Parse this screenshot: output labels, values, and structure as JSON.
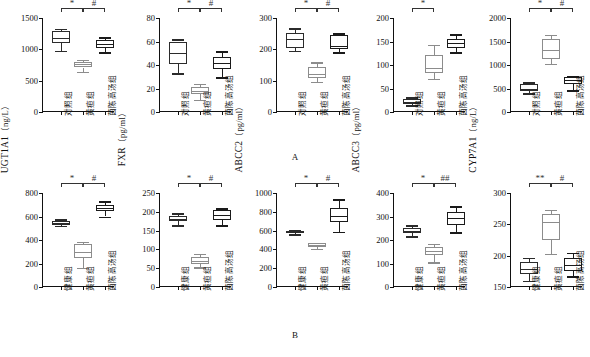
{
  "figure": {
    "row_labels": {
      "a": "A",
      "b": "B"
    },
    "groups_a": [
      "对照组",
      "黄疸组",
      "茵陈高汤组"
    ],
    "groups_b": [
      "健康组",
      "黄疸组",
      "茵陈高汤组"
    ]
  },
  "chart_data": [
    {
      "id": "a-ugt1a1",
      "row": "A",
      "type": "box",
      "title": "UGT1A1",
      "ylabel": "UGT1A1",
      "unit": "（ng/L）",
      "xlabel": "",
      "ylim": [
        0,
        1500
      ],
      "yticks": [
        0,
        500,
        1000,
        1500
      ],
      "categories": [
        "对照组",
        "黄疸组",
        "茵陈高汤组"
      ],
      "boxes": [
        {
          "group": "对照组",
          "min": 980,
          "q1": 1100,
          "median": 1180,
          "q3": 1290,
          "max": 1330
        },
        {
          "group": "黄疸组",
          "min": 640,
          "q1": 710,
          "median": 760,
          "q3": 800,
          "max": 830
        },
        {
          "group": "茵陈高汤组",
          "min": 960,
          "q1": 1020,
          "median": 1090,
          "q3": 1150,
          "max": 1190
        }
      ],
      "significance": [
        {
          "from": 0,
          "to": 1,
          "mark": "*"
        },
        {
          "from": 1,
          "to": 2,
          "mark": "#"
        }
      ]
    },
    {
      "id": "a-fxr",
      "row": "A",
      "type": "box",
      "title": "FXR",
      "ylabel": "FXR",
      "unit": "（pg/ml）",
      "xlabel": "",
      "ylim": [
        0,
        80
      ],
      "yticks": [
        0,
        20,
        40,
        60,
        80
      ],
      "categories": [
        "对照组",
        "黄疸组",
        "茵陈高汤组"
      ],
      "boxes": [
        {
          "group": "对照组",
          "min": 33,
          "q1": 41,
          "median": 50,
          "q3": 60,
          "max": 62
        },
        {
          "group": "黄疸组",
          "min": 10,
          "q1": 15,
          "median": 18,
          "q3": 21,
          "max": 24
        },
        {
          "group": "茵陈高汤组",
          "min": 30,
          "q1": 37,
          "median": 42,
          "q3": 47,
          "max": 52
        }
      ],
      "significance": [
        {
          "from": 0,
          "to": 1,
          "mark": "*"
        },
        {
          "from": 1,
          "to": 2,
          "mark": "#"
        }
      ]
    },
    {
      "id": "a-abcc2",
      "row": "A",
      "type": "box",
      "title": "ABCC2",
      "ylabel": "ABCC2",
      "unit": "（pg/ml）",
      "xlabel": "",
      "ylim": [
        0,
        300
      ],
      "yticks": [
        0,
        100,
        200,
        300
      ],
      "categories": [
        "对照组",
        "黄疸组",
        "茵陈高汤组"
      ],
      "boxes": [
        {
          "group": "对照组",
          "min": 196,
          "q1": 205,
          "median": 232,
          "q3": 252,
          "max": 268
        },
        {
          "group": "黄疸组",
          "min": 95,
          "q1": 110,
          "median": 120,
          "q3": 145,
          "max": 158
        },
        {
          "group": "茵陈高汤组",
          "min": 192,
          "q1": 200,
          "median": 212,
          "q3": 245,
          "max": 252
        }
      ],
      "significance": [
        {
          "from": 0,
          "to": 1,
          "mark": "*"
        },
        {
          "from": 1,
          "to": 2,
          "mark": "#"
        }
      ]
    },
    {
      "id": "a-abcc3",
      "row": "A",
      "type": "box",
      "title": "ABCC3",
      "ylabel": "ABCC3",
      "unit": "（pg/ml）",
      "xlabel": "",
      "ylim": [
        0,
        200
      ],
      "yticks": [
        0,
        50,
        100,
        150,
        200
      ],
      "categories": [
        "对照组",
        "黄疸组",
        "茵陈高汤组"
      ],
      "boxes": [
        {
          "group": "对照组",
          "min": 14,
          "q1": 18,
          "median": 22,
          "q3": 27,
          "max": 31
        },
        {
          "group": "黄疸组",
          "min": 70,
          "q1": 82,
          "median": 93,
          "q3": 122,
          "max": 142
        },
        {
          "group": "茵陈高汤组",
          "min": 127,
          "q1": 136,
          "median": 146,
          "q3": 156,
          "max": 165
        }
      ],
      "significance": [
        {
          "from": 0,
          "to": 1,
          "mark": "*"
        }
      ]
    },
    {
      "id": "a-cyp7a1",
      "row": "A",
      "type": "box",
      "title": "CYP7A1",
      "ylabel": "CYP7A1",
      "unit": "（pg/L）",
      "xlabel": "",
      "ylim": [
        0,
        2000
      ],
      "yticks": [
        0,
        500,
        1000,
        1500,
        2000
      ],
      "categories": [
        "对照组",
        "黄疸组",
        "茵陈高汤组"
      ],
      "boxes": [
        {
          "group": "对照组",
          "min": 400,
          "q1": 450,
          "median": 490,
          "q3": 600,
          "max": 640
        },
        {
          "group": "黄疸组",
          "min": 1030,
          "q1": 1120,
          "median": 1320,
          "q3": 1560,
          "max": 1640
        },
        {
          "group": "茵陈高汤组",
          "min": 470,
          "q1": 600,
          "median": 680,
          "q3": 740,
          "max": 760
        }
      ],
      "significance": [
        {
          "from": 0,
          "to": 1,
          "mark": "*"
        },
        {
          "from": 1,
          "to": 2,
          "mark": "#"
        }
      ]
    },
    {
      "id": "b-ugt1a1",
      "row": "B",
      "type": "box",
      "title": "UGT1A1",
      "ylabel": "UGT1A1",
      "unit": "（ng/L）",
      "xlabel": "",
      "ylim": [
        0,
        800
      ],
      "yticks": [
        0,
        200,
        400,
        600,
        800
      ],
      "categories": [
        "健康组",
        "黄疸组",
        "茵陈高汤组"
      ],
      "boxes": [
        {
          "group": "健康组",
          "min": 520,
          "q1": 530,
          "median": 545,
          "q3": 565,
          "max": 575
        },
        {
          "group": "黄疸组",
          "min": 160,
          "q1": 250,
          "median": 300,
          "q3": 370,
          "max": 385
        },
        {
          "group": "茵陈高汤组",
          "min": 600,
          "q1": 645,
          "median": 670,
          "q3": 700,
          "max": 730
        }
      ],
      "significance": [
        {
          "from": 0,
          "to": 1,
          "mark": "*"
        },
        {
          "from": 1,
          "to": 2,
          "mark": "#"
        }
      ]
    },
    {
      "id": "b-fxr",
      "row": "B",
      "type": "box",
      "title": "FXR",
      "ylabel": "FXR",
      "unit": "（pg/ml）",
      "xlabel": "",
      "ylim": [
        0,
        250
      ],
      "yticks": [
        0,
        50,
        100,
        150,
        200,
        250
      ],
      "categories": [
        "健康组",
        "黄疸组",
        "茵陈高汤组"
      ],
      "boxes": [
        {
          "group": "健康组",
          "min": 165,
          "q1": 175,
          "median": 182,
          "q3": 190,
          "max": 196
        },
        {
          "group": "黄疸组",
          "min": 52,
          "q1": 62,
          "median": 70,
          "q3": 80,
          "max": 88
        },
        {
          "group": "茵陈高汤组",
          "min": 165,
          "q1": 178,
          "median": 192,
          "q3": 205,
          "max": 210
        }
      ],
      "significance": [
        {
          "from": 0,
          "to": 1,
          "mark": "*"
        },
        {
          "from": 1,
          "to": 2,
          "mark": "#"
        }
      ]
    },
    {
      "id": "b-abcc2",
      "row": "B",
      "type": "box",
      "title": "ABCC2",
      "ylabel": "ABCC2",
      "unit": "（pg/ml）",
      "xlabel": "",
      "ylim": [
        0,
        1000
      ],
      "yticks": [
        0,
        200,
        400,
        600,
        800,
        1000
      ],
      "categories": [
        "健康组",
        "黄疸组",
        "茵陈高汤组"
      ],
      "boxes": [
        {
          "group": "健康组",
          "min": 560,
          "q1": 575,
          "median": 590,
          "q3": 600,
          "max": 610
        },
        {
          "group": "黄疸组",
          "min": 405,
          "q1": 430,
          "median": 445,
          "q3": 465,
          "max": 470
        },
        {
          "group": "茵陈高汤组",
          "min": 590,
          "q1": 690,
          "median": 760,
          "q3": 840,
          "max": 940
        }
      ],
      "significance": [
        {
          "from": 0,
          "to": 1,
          "mark": "*"
        },
        {
          "from": 1,
          "to": 2,
          "mark": "#"
        }
      ]
    },
    {
      "id": "b-abcc3",
      "row": "B",
      "type": "box",
      "title": "ABCC3",
      "ylabel": "ABCC3",
      "unit": "（pg/ml）",
      "xlabel": "",
      "ylim": [
        0,
        400
      ],
      "yticks": [
        0,
        100,
        200,
        300,
        400
      ],
      "categories": [
        "健康组",
        "黄疸组",
        "茵陈高汤组"
      ],
      "boxes": [
        {
          "group": "健康组",
          "min": 215,
          "q1": 228,
          "median": 240,
          "q3": 252,
          "max": 262
        },
        {
          "group": "黄疸组",
          "min": 105,
          "q1": 135,
          "median": 152,
          "q3": 172,
          "max": 185
        },
        {
          "group": "茵陈高汤组",
          "min": 232,
          "q1": 262,
          "median": 292,
          "q3": 320,
          "max": 345
        }
      ],
      "significance": [
        {
          "from": 0,
          "to": 1,
          "mark": "*"
        },
        {
          "from": 1,
          "to": 2,
          "mark": "##"
        }
      ]
    },
    {
      "id": "b-cyp7a1",
      "row": "B",
      "type": "box",
      "title": "CYP7A1",
      "ylabel": "CYP7A1",
      "unit": "（ng/L）",
      "xlabel": "",
      "ylim": [
        150,
        300
      ],
      "yticks": [
        150,
        200,
        250,
        300
      ],
      "categories": [
        "健康组",
        "黄疸组",
        "茵陈高汤组"
      ],
      "boxes": [
        {
          "group": "健康组",
          "min": 160,
          "q1": 170,
          "median": 178,
          "q3": 190,
          "max": 197
        },
        {
          "group": "黄疸组",
          "min": 203,
          "q1": 225,
          "median": 253,
          "q3": 267,
          "max": 273
        },
        {
          "group": "茵陈高汤组",
          "min": 168,
          "q1": 175,
          "median": 185,
          "q3": 196,
          "max": 205
        }
      ],
      "significance": [
        {
          "from": 0,
          "to": 1,
          "mark": "**"
        },
        {
          "from": 1,
          "to": 2,
          "mark": "#"
        }
      ]
    }
  ]
}
